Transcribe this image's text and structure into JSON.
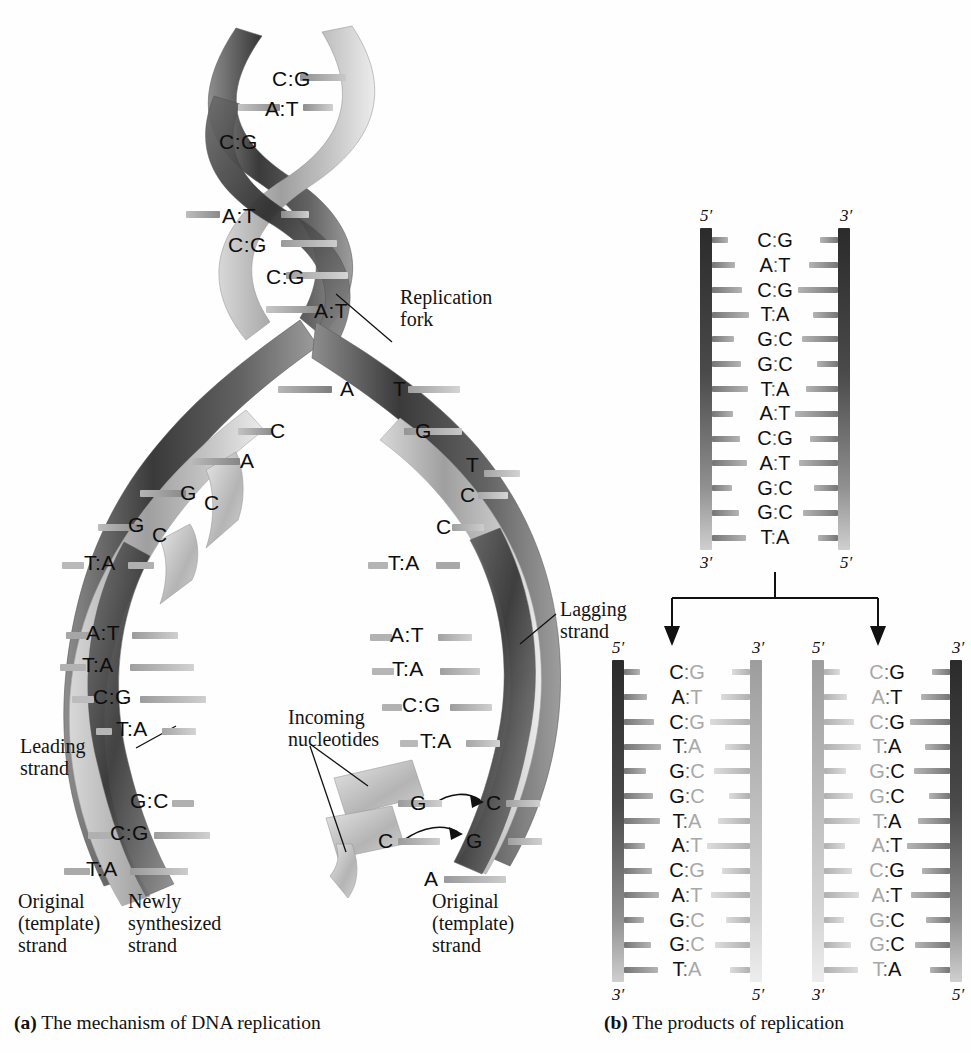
{
  "figure": {
    "panel_a_caption_prefix": "(a)",
    "panel_a_caption": " The mechanism of DNA replication",
    "panel_b_caption_prefix": "(b)",
    "panel_b_caption": " The products of replication"
  },
  "panel_a": {
    "labels": {
      "replication_fork": "Replication\nfork",
      "leading_strand": "Leading\nstrand",
      "lagging_strand": "Lagging\nstrand",
      "incoming_nucleotides": "Incoming\nnucleotides",
      "original_template_left": "Original\n(template)\nstrand",
      "newly_synthesized_left": "Newly\nsynthesized\nstrand",
      "original_template_right": "Original\n(template)\nstrand"
    },
    "parent_duplex_pairs": [
      "C:G",
      "A:T",
      "C:G",
      "A:T",
      "C:G",
      "C:G",
      "A:T"
    ],
    "fork_unpaired_left_template": [
      "A",
      "C",
      "A",
      "G",
      "G"
    ],
    "fork_unpaired_right_template": [
      "T",
      "G",
      "T",
      "C",
      "C"
    ],
    "free_bases_left": [
      "C",
      "C"
    ],
    "leading_branch_pairs": [
      "T:A",
      "A:T",
      "T:A",
      "A:T",
      "T:A",
      "C:G",
      "T:A",
      "G:C",
      "C:G",
      "T:A"
    ],
    "lagging_branch_pairs": [
      "T:A",
      "A:T",
      "T:A",
      "C:G",
      "T:A"
    ],
    "incoming_pairs": [
      {
        "incoming": "G",
        "template": "C"
      },
      {
        "incoming": "C",
        "template": "G"
      }
    ],
    "lagging_tail_base": "A"
  },
  "panel_b": {
    "parent": {
      "top_left_prime": "5′",
      "top_right_prime": "3′",
      "bottom_left_prime": "3′",
      "bottom_right_prime": "5′",
      "left_strand_type": "original",
      "right_strand_type": "original",
      "pairs": [
        "C:G",
        "A:T",
        "C:G",
        "T:A",
        "G:C",
        "G:C",
        "T:A",
        "A:T",
        "C:G",
        "A:T",
        "G:C",
        "G:C",
        "T:A"
      ]
    },
    "daughter_left": {
      "top_left_prime": "5′",
      "top_right_prime": "3′",
      "bottom_left_prime": "3′",
      "bottom_right_prime": "5′",
      "left_strand_type": "original",
      "right_strand_type": "new",
      "pairs": [
        "C:G",
        "A:T",
        "C:G",
        "T:A",
        "G:C",
        "G:C",
        "T:A",
        "A:T",
        "C:G",
        "A:T",
        "G:C",
        "G:C",
        "T:A"
      ]
    },
    "daughter_right": {
      "top_left_prime": "5′",
      "top_right_prime": "3′",
      "bottom_left_prime": "3′",
      "bottom_right_prime": "5′",
      "left_strand_type": "new",
      "right_strand_type": "original",
      "pairs": [
        "C:G",
        "A:T",
        "C:G",
        "T:A",
        "G:C",
        "G:C",
        "T:A",
        "A:T",
        "C:G",
        "A:T",
        "G:C",
        "G:C",
        "T:A"
      ]
    }
  },
  "colors": {
    "template_strand_dark": "#3f3f3f",
    "new_strand_light": "#b9b9b9",
    "ribbon_dark": "#4a4a4a",
    "ribbon_light": "#bdbdbd",
    "rung_gray": "#9a9a9a",
    "text": "#111111"
  }
}
